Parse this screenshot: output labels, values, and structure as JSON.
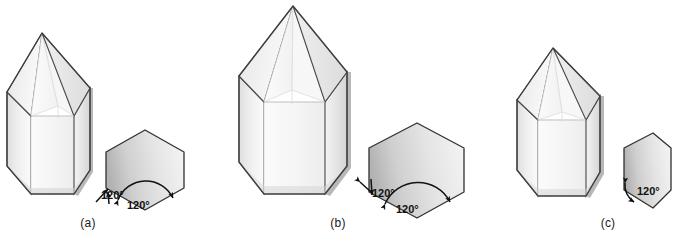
{
  "figure": {
    "background_color": "#ffffff",
    "outline_color": "#3a3a3a",
    "angle_label_color": "#111111",
    "crystal_fill_light": "#fdfdfd",
    "crystal_fill_mid": "#ededed",
    "crystal_fill_shadow": "#d8d8d8",
    "hexagon_fill_light": "#f2f2f2",
    "hexagon_fill_dark": "#bdbdbd"
  },
  "panels": [
    {
      "id": "a",
      "caption": "(a)",
      "crystal": {
        "name": "hexagonal-prism-crystal-a",
        "description": "tall hexagonal prism with pyramidal termination"
      },
      "cross_section": {
        "name": "hexagon-cross-section-a",
        "shape": "regular hexagon",
        "angles": [
          {
            "value": "120°",
            "position": "lower-left-exterior"
          },
          {
            "value": "120°",
            "position": "bottom-interior"
          }
        ]
      }
    },
    {
      "id": "b",
      "caption": "(b)",
      "crystal": {
        "name": "hexagonal-prism-crystal-b",
        "description": "large hexagonal prism with pyramidal termination"
      },
      "cross_section": {
        "name": "hexagon-cross-section-b",
        "shape": "regular hexagon",
        "angles": [
          {
            "value": "120°",
            "position": "lower-left-exterior"
          },
          {
            "value": "120°",
            "position": "bottom-interior"
          }
        ]
      }
    },
    {
      "id": "c",
      "caption": "(c)",
      "crystal": {
        "name": "hexagonal-prism-crystal-c",
        "description": "medium hexagonal prism with pyramidal termination"
      },
      "cross_section": {
        "name": "hexagon-cross-section-c",
        "shape": "distorted narrow hexagon",
        "angles": [
          {
            "value": "120°",
            "position": "lower-left-interior"
          }
        ]
      }
    }
  ]
}
